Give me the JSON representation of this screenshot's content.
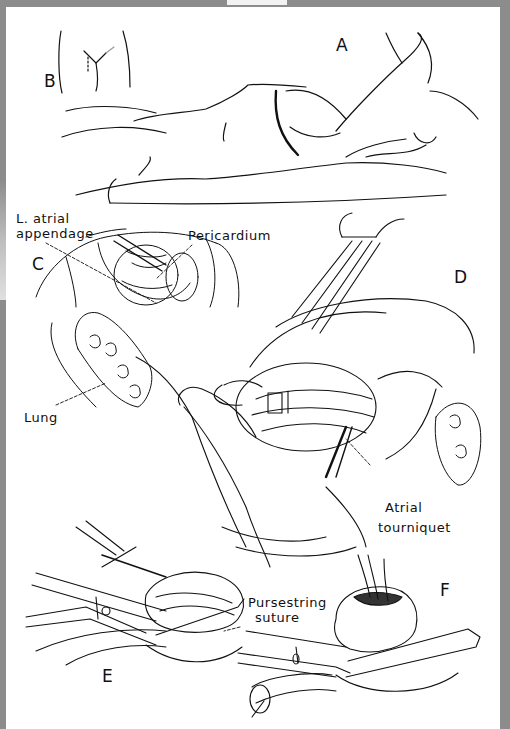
{
  "figure": {
    "panels": {
      "a": "A",
      "b": "B",
      "c": "C",
      "d": "D",
      "e": "E",
      "f": "F"
    },
    "labels": {
      "l_atrial_appendage_line1": "L. atrial",
      "l_atrial_appendage_line2": "appendage",
      "pericardium": "Pericardium",
      "lung": "Lung",
      "atrial_tourniquet_line1": "Atrial",
      "atrial_tourniquet_line2": "tourniquet",
      "pursestring_suture_line1": "Pursestring",
      "pursestring_suture_line2": "suture"
    }
  },
  "colors": {
    "ink": "#111111",
    "page": "#ffffff",
    "border": "#8c8c8c"
  }
}
